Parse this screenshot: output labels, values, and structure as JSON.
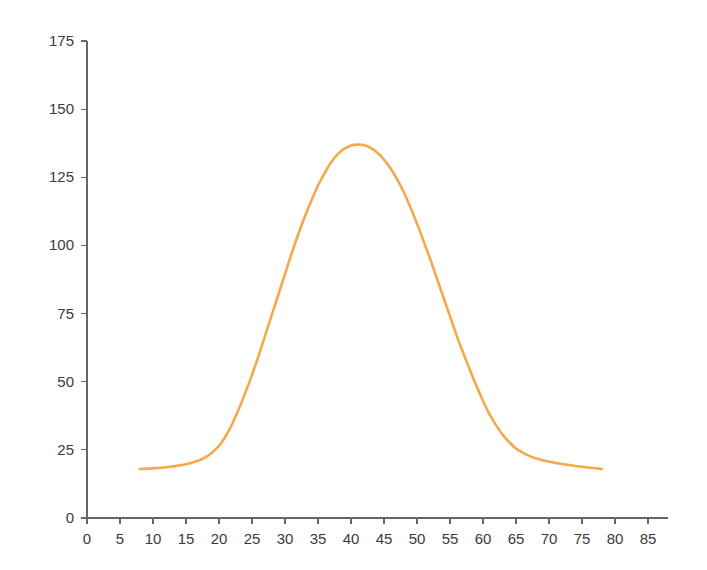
{
  "chart_data": {
    "type": "line",
    "title": "",
    "subtitle": "",
    "xlabel": "",
    "ylabel": "",
    "xlim": [
      0,
      88
    ],
    "ylim": [
      0,
      175
    ],
    "grid": false,
    "legend": null,
    "legend_position": "none",
    "x_ticks": [
      0,
      5,
      10,
      15,
      20,
      25,
      30,
      35,
      40,
      45,
      50,
      55,
      60,
      65,
      70,
      75,
      80,
      85
    ],
    "y_ticks": [
      0,
      25,
      50,
      75,
      100,
      125,
      150,
      175
    ],
    "x_tick_labels": [
      "0",
      "5",
      "10",
      "15",
      "20",
      "25",
      "30",
      "35",
      "40",
      "45",
      "50",
      "55",
      "60",
      "65",
      "70",
      "75",
      "80",
      "85"
    ],
    "y_tick_labels": [
      "0",
      "25",
      "50",
      "75",
      "100",
      "125",
      "150",
      "175"
    ],
    "series": [
      {
        "name": "distribution",
        "color": "#f4a94a",
        "line_width": 2.6,
        "x": [
          8,
          10,
          12,
          14,
          16,
          18,
          20,
          21,
          22,
          23,
          24,
          25,
          26,
          27,
          28,
          29,
          30,
          31,
          32,
          33,
          34,
          35,
          36,
          37,
          38,
          39,
          40,
          41,
          42,
          43,
          44,
          45,
          46,
          47,
          48,
          49,
          50,
          51,
          52,
          53,
          54,
          55,
          56,
          57,
          58,
          59,
          60,
          61,
          62,
          63,
          64,
          65,
          66,
          67,
          68,
          69,
          70,
          72,
          74,
          76,
          78
        ],
        "y": [
          18,
          18.2,
          18.6,
          19.3,
          20.4,
          22.3,
          26.5,
          30,
          34.5,
          40,
          46,
          52.5,
          59.5,
          67,
          74.5,
          82,
          89.5,
          97,
          104,
          110.5,
          116.5,
          122,
          126.5,
          130.5,
          133.5,
          135.5,
          136.7,
          137,
          136.8,
          135.8,
          134,
          131.5,
          128.2,
          124.2,
          119.5,
          114,
          108,
          101.5,
          95,
          88,
          81,
          74,
          67,
          60.5,
          54.5,
          48.5,
          43,
          38,
          34,
          30.5,
          27.8,
          25.5,
          24,
          22.8,
          21.9,
          21.2,
          20.7,
          19.8,
          19.1,
          18.5,
          18
        ]
      }
    ]
  },
  "axes": {
    "x_axis_name": "x-axis",
    "y_axis_name": "y-axis"
  }
}
